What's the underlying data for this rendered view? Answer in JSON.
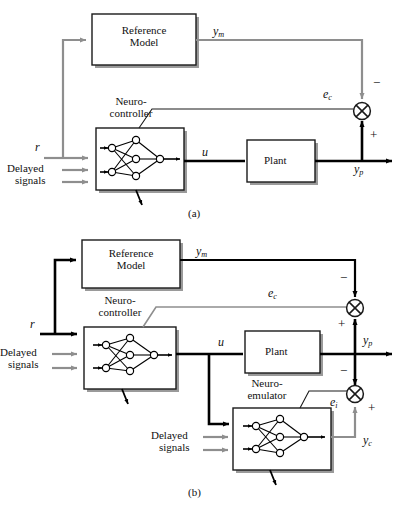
{
  "figure": {
    "type": "block-diagram",
    "panels": [
      {
        "id": "a",
        "caption": "(a)",
        "description": "Model reference adaptive control with neurocontroller only",
        "blocks": [
          {
            "name": "reference-model",
            "label_line1": "Reference",
            "label_line2": "Model"
          },
          {
            "name": "neurocontroller",
            "label_line1": "Neuro-",
            "label_line2": "controller"
          },
          {
            "name": "plant",
            "label_line1": "Plant",
            "label_line2": ""
          }
        ],
        "signals": {
          "reference": "r",
          "delayed_line1": "Delayed",
          "delayed_line2": "signals",
          "model_output": "y",
          "model_output_sub": "m",
          "control": "u",
          "plant_output": "y",
          "plant_output_sub": "p",
          "control_error": "e",
          "control_error_sub": "c"
        },
        "junctions": [
          {
            "name": "control-error-sum",
            "sign_top": "−",
            "sign_bottom": "+"
          }
        ]
      },
      {
        "id": "b",
        "caption": "(b)",
        "description": "Model reference adaptive control with neurocontroller and neuro-emulator",
        "blocks": [
          {
            "name": "reference-model",
            "label_line1": "Reference",
            "label_line2": "Model"
          },
          {
            "name": "neurocontroller",
            "label_line1": "Neuro-",
            "label_line2": "controller"
          },
          {
            "name": "plant",
            "label_line1": "Plant",
            "label_line2": ""
          },
          {
            "name": "neuro-emulator",
            "label_line1": "Neuro-",
            "label_line2": "emulator"
          }
        ],
        "signals": {
          "reference": "r",
          "delayed_line1": "Delayed",
          "delayed_line2": "signals",
          "delayed2_line1": "Delayed",
          "delayed2_line2": "signals",
          "model_output": "y",
          "model_output_sub": "m",
          "control": "u",
          "plant_output": "y",
          "plant_output_sub": "p",
          "control_error": "e",
          "control_error_sub": "c",
          "identification_error": "e",
          "identification_error_sub": "i",
          "emulator_output": "y",
          "emulator_output_sub": "c"
        },
        "junctions": [
          {
            "name": "control-error-sum",
            "sign_top": "−",
            "sign_bottom": "+"
          },
          {
            "name": "identification-error-sum",
            "sign_top": "−",
            "sign_bottom": "+"
          }
        ]
      }
    ],
    "network": {
      "name": "feedforward-neural-network",
      "input_nodes": 2,
      "hidden_nodes": 3,
      "output_nodes": 1
    },
    "colors": {
      "signal_gray": "#8e8e8e",
      "signal_black": "#000000",
      "box_stroke": "#1a1a1a",
      "shadow": "#9a9a9a",
      "text": "#111111",
      "background": "#ffffff"
    }
  }
}
